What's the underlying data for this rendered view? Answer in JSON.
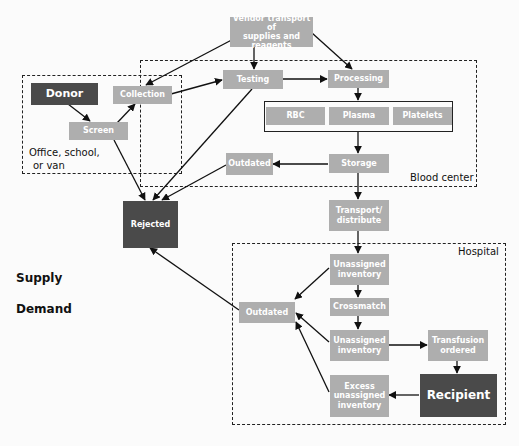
{
  "regions": {
    "office": "Office, school, or van",
    "office_line1": "Office, school,",
    "office_line2": "or van",
    "blood_center": "Blood center",
    "hospital": "Hospital"
  },
  "side_labels": {
    "supply": "Supply",
    "demand": "Demand"
  },
  "nodes": {
    "vendor": "Vendor transport of supplies and reagents",
    "vendor_l1": "Vendor transport of",
    "vendor_l2": "supplies and reagents",
    "donor": "Donor",
    "collection": "Collection",
    "screen": "Screen",
    "testing": "Testing",
    "processing": "Processing",
    "rbc": "RBC",
    "plasma": "Plasma",
    "platelets": "Platelets",
    "storage": "Storage",
    "outdated_bc": "Outdated",
    "transport_l1": "Transport/",
    "transport_l2": "distribute",
    "rejected": "Rejected",
    "unassigned1_l1": "Unassigned",
    "unassigned1_l2": "inventory",
    "crossmatch": "Crossmatch",
    "unassigned2_l1": "Unassigned",
    "unassigned2_l2": "inventory",
    "transfusion_l1": "Transfusion",
    "transfusion_l2": "ordered",
    "excess_l1": "Excess",
    "excess_l2": "unassigned",
    "excess_l3": "inventory",
    "recipient": "Recipient",
    "outdated_h": "Outdated"
  },
  "edges": [
    [
      "vendor",
      "collection"
    ],
    [
      "vendor",
      "testing"
    ],
    [
      "vendor",
      "processing"
    ],
    [
      "donor",
      "screen"
    ],
    [
      "screen",
      "collection"
    ],
    [
      "screen",
      "rejected"
    ],
    [
      "collection",
      "testing"
    ],
    [
      "testing",
      "processing"
    ],
    [
      "testing",
      "rejected"
    ],
    [
      "processing",
      "components"
    ],
    [
      "components",
      "storage"
    ],
    [
      "storage",
      "outdated_bc"
    ],
    [
      "outdated_bc",
      "rejected"
    ],
    [
      "storage",
      "transport"
    ],
    [
      "transport",
      "unassigned1"
    ],
    [
      "unassigned1",
      "crossmatch"
    ],
    [
      "unassigned1",
      "outdated_h"
    ],
    [
      "crossmatch",
      "unassigned2"
    ],
    [
      "unassigned2",
      "outdated_h"
    ],
    [
      "unassigned2",
      "transfusion"
    ],
    [
      "transfusion",
      "recipient"
    ],
    [
      "recipient",
      "excess"
    ],
    [
      "excess",
      "outdated_h"
    ],
    [
      "outdated_h",
      "rejected"
    ]
  ],
  "colors": {
    "node": "#aeaeae",
    "dark_node": "#4a4a4a",
    "line": "#111111"
  }
}
